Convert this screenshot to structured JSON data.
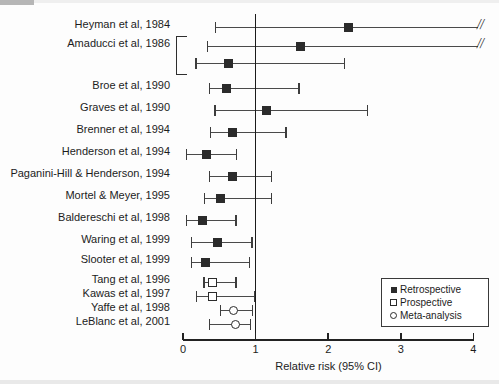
{
  "chart_data": {
    "type": "forest",
    "title": "",
    "xlabel": "Relative risk (95% CI)",
    "ylabel": "",
    "xlim": [
      0,
      4
    ],
    "xticks": [
      0,
      1,
      2,
      3,
      4
    ],
    "xticklabels": [
      "0",
      "1",
      "2",
      "3",
      "4"
    ],
    "reference_line": 1,
    "grid": false,
    "legend_position": "bottom-right",
    "legend": [
      {
        "label": "Retrospective",
        "marker": "filled-square"
      },
      {
        "label": "Prospective",
        "marker": "open-square"
      },
      {
        "label": "Meta-analysis",
        "marker": "open-circle"
      }
    ],
    "bracket_groups": [
      {
        "label": "Amaducci et al, 1986",
        "row_indices": [
          1,
          2
        ]
      }
    ],
    "rows": [
      {
        "label": "Heyman et al, 1984",
        "rr": 2.27,
        "ci_low": 0.44,
        "ci_high": 4.0,
        "truncated_high": true,
        "marker": "filled-square",
        "type": "Retrospective"
      },
      {
        "label": "Amaducci et al, 1986",
        "rr": 1.61,
        "ci_low": 0.33,
        "ci_high": 4.0,
        "truncated_high": true,
        "marker": "filled-square",
        "type": "Retrospective"
      },
      {
        "label": "",
        "rr": 0.62,
        "ci_low": 0.17,
        "ci_high": 2.22,
        "truncated_high": false,
        "marker": "filled-square",
        "type": "Retrospective"
      },
      {
        "label": "Broe et al, 1990",
        "rr": 0.59,
        "ci_low": 0.36,
        "ci_high": 1.59,
        "truncated_high": false,
        "marker": "filled-square",
        "type": "Retrospective"
      },
      {
        "label": "Graves et al, 1990",
        "rr": 1.15,
        "ci_low": 0.43,
        "ci_high": 2.53,
        "truncated_high": false,
        "marker": "filled-square",
        "type": "Retrospective"
      },
      {
        "label": "Brenner et al, 1994",
        "rr": 0.68,
        "ci_low": 0.37,
        "ci_high": 1.41,
        "truncated_high": false,
        "marker": "filled-square",
        "type": "Retrospective"
      },
      {
        "label": "Henderson et al, 1994",
        "rr": 0.32,
        "ci_low": 0.04,
        "ci_high": 0.73,
        "truncated_high": false,
        "marker": "filled-square",
        "type": "Retrospective"
      },
      {
        "label": "Paganini-Hill & Henderson, 1994",
        "rr": 0.68,
        "ci_low": 0.36,
        "ci_high": 1.21,
        "truncated_high": false,
        "marker": "filled-square",
        "type": "Retrospective"
      },
      {
        "label": "Mortel & Meyer, 1995",
        "rr": 0.51,
        "ci_low": 0.29,
        "ci_high": 1.21,
        "truncated_high": false,
        "marker": "filled-square",
        "type": "Retrospective"
      },
      {
        "label": "Baldereschi et al, 1998",
        "rr": 0.26,
        "ci_low": 0.04,
        "ci_high": 0.72,
        "truncated_high": false,
        "marker": "filled-square",
        "type": "Retrospective"
      },
      {
        "label": "Waring et al, 1999",
        "rr": 0.47,
        "ci_low": 0.11,
        "ci_high": 0.94,
        "truncated_high": false,
        "marker": "filled-square",
        "type": "Retrospective"
      },
      {
        "label": "Slooter et al, 1999",
        "rr": 0.3,
        "ci_low": 0.11,
        "ci_high": 0.91,
        "truncated_high": false,
        "marker": "filled-square",
        "type": "Retrospective"
      },
      {
        "label": "Tang et al, 1996",
        "rr": 0.4,
        "ci_low": 0.28,
        "ci_high": 0.72,
        "truncated_high": false,
        "marker": "open-square",
        "type": "Prospective"
      },
      {
        "label": "Kawas et al, 1997",
        "rr": 0.4,
        "ci_low": 0.18,
        "ci_high": 0.98,
        "truncated_high": false,
        "marker": "open-square",
        "type": "Prospective"
      },
      {
        "label": "Yaffe et al, 1998",
        "rr": 0.69,
        "ci_low": 0.51,
        "ci_high": 0.95,
        "truncated_high": false,
        "marker": "open-circle",
        "type": "Meta-analysis"
      },
      {
        "label": "LeBlanc et al, 2001",
        "rr": 0.72,
        "ci_low": 0.36,
        "ci_high": 0.92,
        "truncated_high": false,
        "marker": "open-circle",
        "type": "Meta-analysis"
      }
    ]
  },
  "axis": {
    "title": "Relative risk (95% CI)",
    "ticklabels": [
      "0",
      "1",
      "2",
      "3",
      "4"
    ]
  },
  "legend": {
    "items": [
      {
        "label": "Retrospective"
      },
      {
        "label": "Prospective"
      },
      {
        "label": "Meta-analysis"
      }
    ]
  },
  "colors": {
    "marker": "#2b2b2b",
    "line": "#4a4a4a",
    "axis": "#222222",
    "background": "#fdfdfd"
  }
}
